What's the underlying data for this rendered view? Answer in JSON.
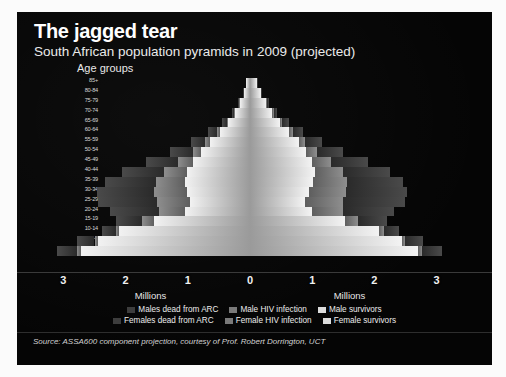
{
  "header": {
    "title": "The jagged tear",
    "subtitle": "South African population pyramids in 2009 (projected)",
    "age_axis_label": "Age groups"
  },
  "source": {
    "text": "Source: ASSA600 component projection, courtesy of Prof. Robert Dorrington, UCT"
  },
  "legend": {
    "row1": [
      {
        "label": "Males dead from ARC",
        "swatch": "#3d3d3d",
        "name": "legend-males-dead"
      },
      {
        "label": "Male HIV infection",
        "swatch": "#7a7a7a",
        "name": "legend-male-hiv"
      },
      {
        "label": "Male survivors",
        "swatch": "#dcdcdc",
        "name": "legend-male-survivors"
      }
    ],
    "row2": [
      {
        "label": "Females dead from ARC",
        "swatch": "#3d3d3d",
        "name": "legend-females-dead"
      },
      {
        "label": "Female HIV infection",
        "swatch": "#7a7a7a",
        "name": "legend-female-hiv"
      },
      {
        "label": "Female survivors",
        "swatch": "#dcdcdc",
        "name": "legend-female-survivors"
      }
    ]
  },
  "chart_data": {
    "type": "bar",
    "subtype": "population-pyramid-stacked",
    "title": "The jagged tear",
    "subtitle": "South African population pyramids in 2009 (projected)",
    "xlabel": "Millions",
    "ylabel": "Age groups",
    "xlim": [
      -3.2,
      3.2
    ],
    "xticks": [
      3,
      2,
      1,
      0,
      1,
      2,
      3
    ],
    "xtick_labels": [
      "3",
      "2",
      "1",
      "0",
      "1",
      "2",
      "3"
    ],
    "units": "millions",
    "grid": false,
    "legend_position": "bottom",
    "left_side": "Males",
    "right_side": "Females",
    "categories": [
      "85+",
      "80-84",
      "75-79",
      "70-74",
      "65-69",
      "60-64",
      "55-59",
      "50-54",
      "45-49",
      "40-44",
      "35-39",
      "30-34",
      "25-29",
      "20-24",
      "15-19",
      "10-14",
      "5-9",
      "0-4"
    ],
    "segments": [
      "survivors",
      "hiv_infection",
      "dead_from_ARC"
    ],
    "series": [
      {
        "name": "Male survivors",
        "side": "left",
        "segment": "survivors",
        "values": [
          0.06,
          0.1,
          0.16,
          0.24,
          0.35,
          0.49,
          0.64,
          0.78,
          0.92,
          1.02,
          1.05,
          1.02,
          0.96,
          1.05,
          1.55,
          2.1,
          2.45,
          2.72
        ]
      },
      {
        "name": "Male HIV infection",
        "side": "left",
        "segment": "hiv_infection",
        "values": [
          0.0,
          0.0,
          0.01,
          0.01,
          0.02,
          0.04,
          0.08,
          0.14,
          0.24,
          0.36,
          0.46,
          0.52,
          0.54,
          0.42,
          0.18,
          0.06,
          0.05,
          0.06
        ]
      },
      {
        "name": "Males dead from ARC",
        "side": "left",
        "segment": "dead_from_ARC",
        "values": [
          0.0,
          0.01,
          0.02,
          0.04,
          0.08,
          0.14,
          0.23,
          0.36,
          0.52,
          0.68,
          0.82,
          0.92,
          0.95,
          0.78,
          0.42,
          0.22,
          0.28,
          0.32
        ]
      },
      {
        "name": "Female survivors",
        "side": "right",
        "segment": "survivors",
        "values": [
          0.12,
          0.18,
          0.26,
          0.36,
          0.49,
          0.63,
          0.78,
          0.9,
          1.0,
          1.05,
          1.02,
          0.95,
          0.88,
          1.0,
          1.52,
          2.08,
          2.44,
          2.7
        ]
      },
      {
        "name": "Female HIV infection",
        "side": "right",
        "segment": "hiv_infection",
        "values": [
          0.0,
          0.0,
          0.01,
          0.02,
          0.03,
          0.06,
          0.1,
          0.18,
          0.3,
          0.44,
          0.54,
          0.6,
          0.62,
          0.5,
          0.22,
          0.07,
          0.05,
          0.06
        ]
      },
      {
        "name": "Females dead from ARC",
        "side": "right",
        "segment": "dead_from_ARC",
        "values": [
          0.01,
          0.01,
          0.03,
          0.05,
          0.1,
          0.17,
          0.27,
          0.42,
          0.6,
          0.76,
          0.9,
          0.98,
          1.0,
          0.82,
          0.46,
          0.24,
          0.29,
          0.33
        ]
      }
    ],
    "totals_left": [
      0.06,
      0.11,
      0.19,
      0.29,
      0.45,
      0.67,
      0.95,
      1.28,
      1.68,
      2.06,
      2.33,
      2.46,
      2.45,
      2.25,
      2.15,
      2.38,
      2.78,
      3.1
    ],
    "totals_right": [
      0.13,
      0.19,
      0.3,
      0.43,
      0.62,
      0.86,
      1.15,
      1.5,
      1.9,
      2.25,
      2.46,
      2.53,
      2.5,
      2.32,
      2.2,
      2.39,
      2.78,
      3.09
    ]
  }
}
